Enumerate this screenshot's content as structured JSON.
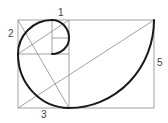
{
  "diagram": {
    "labels": [
      {
        "id": "one",
        "text": "1",
        "x": 61,
        "y": 16
      },
      {
        "id": "two",
        "text": "2",
        "x": 9,
        "y": 37
      },
      {
        "id": "three",
        "text": "3",
        "x": 41,
        "y": 117
      },
      {
        "id": "five",
        "text": "5",
        "x": 157,
        "y": 66
      }
    ],
    "colors": {
      "spiral": "#1a1a1a",
      "grid": "#8a8a8a",
      "label": "#444444",
      "background": "#ffffff"
    }
  }
}
